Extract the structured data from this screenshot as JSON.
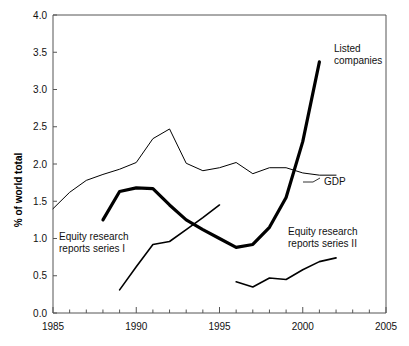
{
  "chart_data": {
    "type": "line",
    "title": "",
    "subtitle": "",
    "xlabel": "",
    "ylabel": "% of world total",
    "xlim": [
      1985,
      2005
    ],
    "ylim": [
      0.0,
      4.0
    ],
    "grid": false,
    "legend_position": "inline-annotations",
    "x_ticks": [
      "1985",
      "1990",
      "1995",
      "2000",
      "2005"
    ],
    "x_tick_values": [
      1985,
      1990,
      1995,
      2000,
      2005
    ],
    "x_minor_tick_interval": 1,
    "y_ticks": [
      "0.0",
      "0.5",
      "1.0",
      "1.5",
      "2.0",
      "2.5",
      "3.0",
      "3.5",
      "4.0"
    ],
    "y_tick_values": [
      0.0,
      0.5,
      1.0,
      1.5,
      2.0,
      2.5,
      3.0,
      3.5,
      4.0
    ],
    "series": [
      {
        "name": "GDP",
        "label": "GDP",
        "style": "thin",
        "color": "#000000",
        "x": [
          1985,
          1986,
          1987,
          1988,
          1989,
          1990,
          1991,
          1992,
          1993,
          1994,
          1995,
          1996,
          1997,
          1998,
          1999,
          2000,
          2001,
          2002
        ],
        "values": [
          1.4,
          1.62,
          1.78,
          1.86,
          1.93,
          2.02,
          2.34,
          2.47,
          2.01,
          1.91,
          1.95,
          2.02,
          1.87,
          1.95,
          1.95,
          1.88,
          1.85,
          1.85
        ]
      },
      {
        "name": "Listed companies",
        "label": "Listed\ncompanies",
        "style": "thick",
        "color": "#000000",
        "x": [
          1988,
          1989,
          1990,
          1991,
          1992,
          1993,
          1994,
          1995,
          1996,
          1997,
          1998,
          1999,
          2000,
          2001
        ],
        "values": [
          1.25,
          1.63,
          1.68,
          1.67,
          1.45,
          1.25,
          1.12,
          1.0,
          0.88,
          0.92,
          1.15,
          1.55,
          2.3,
          3.37
        ]
      },
      {
        "name": "Equity research reports series I",
        "label": "Equity research\nreports series I",
        "style": "medium",
        "color": "#000000",
        "x": [
          1989,
          1990,
          1991,
          1992,
          1993,
          1994,
          1995
        ],
        "values": [
          0.31,
          0.62,
          0.92,
          0.96,
          1.12,
          1.28,
          1.45
        ]
      },
      {
        "name": "Equity research reports series II",
        "label": "Equity research\nreports series II",
        "style": "medium",
        "color": "#000000",
        "x": [
          1996,
          1997,
          1998,
          1999,
          2000,
          2001,
          2002
        ],
        "values": [
          0.42,
          0.35,
          0.47,
          0.45,
          0.58,
          0.69,
          0.74
        ]
      }
    ],
    "annotations": [
      {
        "id": "listed-companies",
        "text_line1": "Listed",
        "text_line2": "companies",
        "x": 334,
        "y": 52
      },
      {
        "id": "gdp",
        "text_line1": "GDP",
        "text_line2": "",
        "x": 324,
        "y": 185
      },
      {
        "id": "equity-series-1",
        "text_line1": "Equity research",
        "text_line2": "reports series I",
        "x": 59,
        "y": 240
      },
      {
        "id": "equity-series-2",
        "text_line1": "Equity research",
        "text_line2": "reports series II",
        "x": 288,
        "y": 235
      }
    ]
  }
}
